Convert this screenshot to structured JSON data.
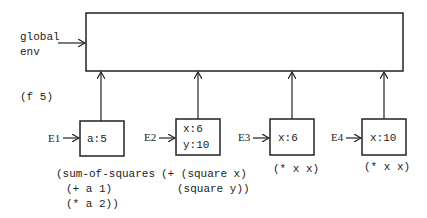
{
  "global_env": {
    "label_line1": "global",
    "label_line2": "env"
  },
  "call": "(f 5)",
  "frames": [
    {
      "name": "E1",
      "bindings": [
        "a:5"
      ],
      "body": [
        "(sum-of-squares",
        "(+ a 1)",
        "(* a 2))"
      ]
    },
    {
      "name": "E2",
      "bindings": [
        "x:6",
        "y:10"
      ],
      "body": [
        "(+ (square x)",
        "(square y))"
      ]
    },
    {
      "name": "E3",
      "bindings": [
        "x:6"
      ],
      "body": [
        "(* x x)"
      ]
    },
    {
      "name": "E4",
      "bindings": [
        "x:10"
      ],
      "body": [
        "(* x x)"
      ]
    }
  ]
}
